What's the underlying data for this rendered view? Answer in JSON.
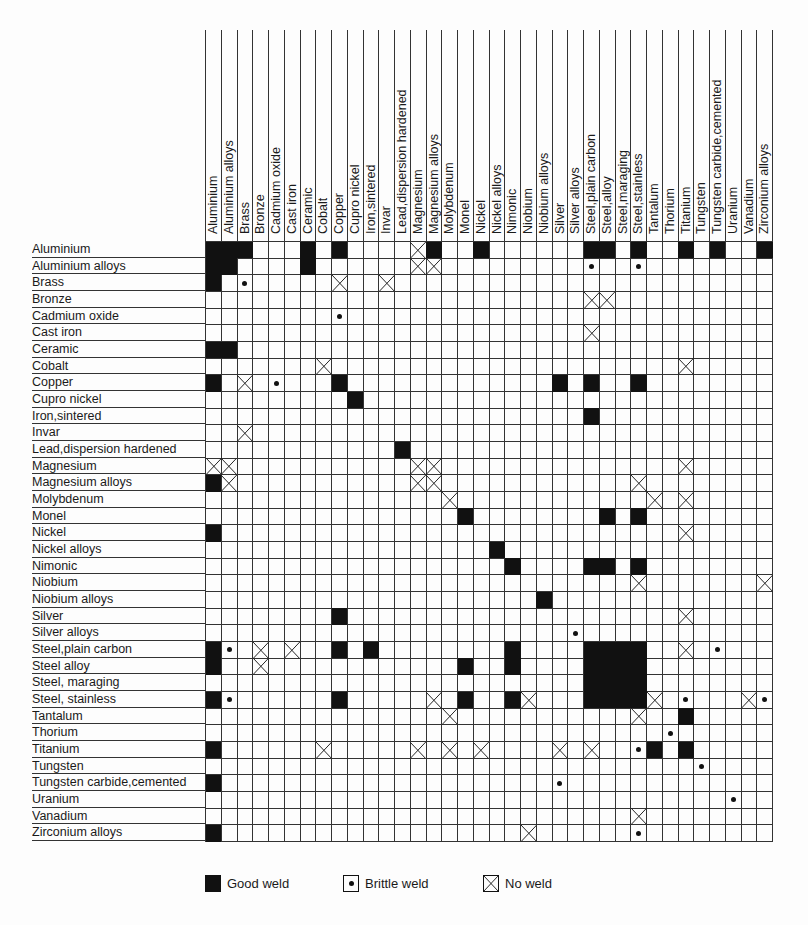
{
  "chart_data": {
    "type": "table",
    "title": "",
    "materials": [
      "Aluminium",
      "Aluminium alloys",
      "Brass",
      "Bronze",
      "Cadmium oxide",
      "Cast iron",
      "Ceramic",
      "Cobalt",
      "Copper",
      "Cupro nickel",
      "Iron,sintered",
      "Invar",
      "Lead,dispersion hardened",
      "Magnesium",
      "Magnesium alloys",
      "Molybdenum",
      "Monel",
      "Nickel",
      "Nickel alloys",
      "Nimonic",
      "Niobium",
      "Niobium alloys",
      "Silver",
      "Silver alloys",
      "Steel,plain carbon",
      "Steel,alloy",
      "Steel,maraging",
      "Steel,stainless",
      "Tantalum",
      "Thorium",
      "Titanium",
      "Tungsten",
      "Tungsten carbide,cemented",
      "Uranium",
      "Vanadium",
      "Zirconium alloys"
    ],
    "row_labels": [
      "Aluminium",
      "Aluminium alloys",
      "Brass",
      "Bronze",
      "Cadmium oxide",
      "Cast iron",
      "Ceramic",
      "Cobalt",
      "Copper",
      "Cupro nickel",
      "Iron,sintered",
      "Invar",
      "Lead,dispersion hardened",
      "Magnesium",
      "Magnesium alloys",
      "Molybdenum",
      "Monel",
      "Nickel",
      "Nickel alloys",
      "Nimonic",
      "Niobium",
      "Niobium alloys",
      "Silver",
      "Silver alloys",
      "Steel,plain carbon",
      "Steel alloy",
      "Steel, maraging",
      "Steel, stainless",
      "Tantalum",
      "Thorium",
      "Titanium",
      "Tungsten",
      "Tungsten carbide,cemented",
      "Uranium",
      "Vanadium",
      "Zirconium alloys"
    ],
    "legend": [
      {
        "key": "G",
        "label": "Good weld",
        "symbol": "filled-square"
      },
      {
        "key": "B",
        "label": "Brittle weld",
        "symbol": "dot"
      },
      {
        "key": "X",
        "label": "No weld",
        "symbol": "cross"
      }
    ],
    "cells": [
      {
        "row": 0,
        "G": [
          0,
          1,
          2,
          6,
          8,
          14,
          17,
          24,
          25,
          27,
          30,
          32,
          35
        ],
        "B": [],
        "X": [
          13
        ]
      },
      {
        "row": 1,
        "G": [
          0,
          1,
          6
        ],
        "B": [
          24,
          27
        ],
        "X": [
          13,
          14
        ]
      },
      {
        "row": 2,
        "G": [
          0
        ],
        "B": [
          2
        ],
        "X": [
          8,
          11
        ]
      },
      {
        "row": 3,
        "G": [],
        "B": [],
        "X": [
          24,
          25
        ]
      },
      {
        "row": 4,
        "G": [],
        "B": [
          8
        ],
        "X": []
      },
      {
        "row": 5,
        "G": [],
        "B": [],
        "X": [
          24
        ]
      },
      {
        "row": 6,
        "G": [
          0,
          1
        ],
        "B": [],
        "X": []
      },
      {
        "row": 7,
        "G": [],
        "B": [],
        "X": [
          7,
          30
        ]
      },
      {
        "row": 8,
        "G": [
          0,
          8,
          22,
          24,
          27
        ],
        "B": [
          4
        ],
        "X": [
          2
        ]
      },
      {
        "row": 9,
        "G": [
          9
        ],
        "B": [],
        "X": []
      },
      {
        "row": 10,
        "G": [
          24
        ],
        "B": [],
        "X": []
      },
      {
        "row": 11,
        "G": [],
        "B": [],
        "X": [
          2
        ]
      },
      {
        "row": 12,
        "G": [
          12
        ],
        "B": [],
        "X": []
      },
      {
        "row": 13,
        "G": [],
        "B": [],
        "X": [
          0,
          1,
          13,
          14,
          30
        ]
      },
      {
        "row": 14,
        "G": [
          0
        ],
        "B": [],
        "X": [
          1,
          13,
          14,
          27
        ]
      },
      {
        "row": 15,
        "G": [],
        "B": [],
        "X": [
          15,
          28,
          30
        ]
      },
      {
        "row": 16,
        "G": [
          16,
          25,
          27
        ],
        "B": [],
        "X": []
      },
      {
        "row": 17,
        "G": [
          0
        ],
        "B": [],
        "X": [
          30
        ]
      },
      {
        "row": 18,
        "G": [
          18
        ],
        "B": [],
        "X": []
      },
      {
        "row": 19,
        "G": [
          19,
          24,
          25,
          27
        ],
        "B": [],
        "X": []
      },
      {
        "row": 20,
        "G": [],
        "B": [],
        "X": [
          27,
          35
        ]
      },
      {
        "row": 21,
        "G": [
          21
        ],
        "B": [],
        "X": []
      },
      {
        "row": 22,
        "G": [
          8
        ],
        "B": [],
        "X": [
          30
        ]
      },
      {
        "row": 23,
        "G": [],
        "B": [
          23
        ],
        "X": []
      },
      {
        "row": 24,
        "G": [
          0,
          8,
          10,
          19,
          24,
          25,
          26,
          27
        ],
        "B": [
          1,
          32
        ],
        "X": [
          3,
          5,
          30
        ]
      },
      {
        "row": 25,
        "G": [
          0,
          16,
          19,
          24,
          25,
          26,
          27
        ],
        "B": [],
        "X": [
          3
        ]
      },
      {
        "row": 26,
        "G": [
          24,
          25,
          26,
          27
        ],
        "B": [],
        "X": []
      },
      {
        "row": 27,
        "G": [
          0,
          8,
          16,
          19,
          24,
          25,
          26,
          27
        ],
        "B": [
          1,
          30,
          35
        ],
        "X": [
          14,
          20,
          28,
          34
        ]
      },
      {
        "row": 28,
        "G": [
          30
        ],
        "B": [],
        "X": [
          15,
          27
        ]
      },
      {
        "row": 29,
        "G": [],
        "B": [
          29
        ],
        "X": []
      },
      {
        "row": 30,
        "G": [
          0,
          28,
          30
        ],
        "B": [
          27
        ],
        "X": [
          7,
          13,
          15,
          17,
          22,
          24
        ]
      },
      {
        "row": 31,
        "G": [],
        "B": [
          31
        ],
        "X": []
      },
      {
        "row": 32,
        "G": [
          0
        ],
        "B": [
          22
        ],
        "X": []
      },
      {
        "row": 33,
        "G": [],
        "B": [
          33
        ],
        "X": []
      },
      {
        "row": 34,
        "G": [],
        "B": [],
        "X": [
          27
        ]
      },
      {
        "row": 35,
        "G": [
          0
        ],
        "B": [
          27
        ],
        "X": [
          20
        ]
      }
    ]
  },
  "legend": {
    "good_label": "Good weld",
    "brittle_label": "Brittle weld",
    "noweld_label": "No weld"
  },
  "colors": {
    "ink": "#111111",
    "paper": "#fdfdfd",
    "grid": "#333333"
  }
}
